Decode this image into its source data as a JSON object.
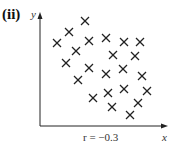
{
  "panel_label": "(ii)",
  "chart_data": {
    "type": "scatter",
    "title": "",
    "xlabel": "x",
    "ylabel": "y",
    "annotation": "r = −0.3",
    "marker": "x",
    "xlim": [
      0,
      127
    ],
    "ylim": [
      0,
      111
    ],
    "grid": false,
    "legend": "none",
    "x_ticks": [],
    "y_ticks": [],
    "points": [
      {
        "x": 45,
        "y": 105
      },
      {
        "x": 29,
        "y": 94
      },
      {
        "x": 17,
        "y": 83
      },
      {
        "x": 49,
        "y": 85
      },
      {
        "x": 66,
        "y": 88
      },
      {
        "x": 84,
        "y": 84
      },
      {
        "x": 100,
        "y": 84
      },
      {
        "x": 36,
        "y": 75
      },
      {
        "x": 73,
        "y": 71
      },
      {
        "x": 95,
        "y": 70
      },
      {
        "x": 26,
        "y": 63
      },
      {
        "x": 49,
        "y": 58
      },
      {
        "x": 66,
        "y": 52
      },
      {
        "x": 83,
        "y": 57
      },
      {
        "x": 102,
        "y": 50
      },
      {
        "x": 38,
        "y": 46
      },
      {
        "x": 68,
        "y": 33
      },
      {
        "x": 84,
        "y": 37
      },
      {
        "x": 107,
        "y": 35
      },
      {
        "x": 53,
        "y": 28
      },
      {
        "x": 98,
        "y": 23
      },
      {
        "x": 72,
        "y": 19
      },
      {
        "x": 90,
        "y": 11
      }
    ]
  }
}
